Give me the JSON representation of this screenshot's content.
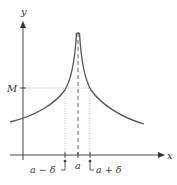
{
  "figure": {
    "axes": {
      "x_label": "x",
      "y_label": "y"
    },
    "labels": {
      "M": "M",
      "a": "a",
      "a_minus_delta": "a − δ",
      "a_plus_delta": "a + δ"
    },
    "colors": {
      "curve": "#555555",
      "axis": "#333333",
      "guide": "#999999"
    }
  }
}
